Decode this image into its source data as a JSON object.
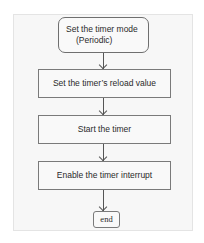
{
  "diagram": {
    "type": "flowchart",
    "nodes": [
      {
        "id": "n1",
        "shape": "rounded-rect",
        "line1": "Set the timer mode",
        "line2": "(Periodic)"
      },
      {
        "id": "n2",
        "shape": "rect",
        "label": "Set the timer’s reload value"
      },
      {
        "id": "n3",
        "shape": "rect",
        "label": "Start the timer"
      },
      {
        "id": "n4",
        "shape": "rect",
        "label": "Enable the timer interrupt"
      },
      {
        "id": "n5",
        "shape": "rounded-rect",
        "label": "end"
      }
    ],
    "edges": [
      {
        "from": "n1",
        "to": "n2"
      },
      {
        "from": "n2",
        "to": "n3"
      },
      {
        "from": "n3",
        "to": "n4"
      },
      {
        "from": "n4",
        "to": "n5"
      }
    ]
  }
}
